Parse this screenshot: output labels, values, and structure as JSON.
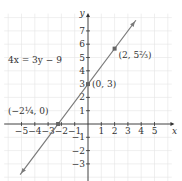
{
  "chart_data": {
    "type": "line",
    "title": "",
    "equation": "4x = 3y − 9",
    "xlabel": "x",
    "ylabel": "y",
    "xlim": [
      -6,
      6
    ],
    "ylim": [
      -4,
      8
    ],
    "x_ticks": [
      -5,
      -4,
      -3,
      -2,
      -1,
      1,
      2,
      3,
      4,
      5
    ],
    "y_ticks": [
      -3,
      -2,
      -1,
      1,
      2,
      3,
      4,
      5,
      6,
      7
    ],
    "grid": true,
    "line": {
      "slope": 1.3333,
      "intercept": 3,
      "color": "#7a7a7a"
    },
    "points": [
      {
        "x": -2.25,
        "y": 0,
        "label": "(−2¼, 0)"
      },
      {
        "x": 0,
        "y": 3,
        "label": "(0, 3)"
      },
      {
        "x": 2,
        "y": 5.6667,
        "label": "(2, 5⅔)"
      }
    ]
  },
  "labels": {
    "equation": "4x = 3y − 9",
    "x_axis": "x",
    "y_axis": "y",
    "pt1": "(−2¼, 0)",
    "pt2": "(0, 3)",
    "pt3": "(2, 5⅔)"
  }
}
